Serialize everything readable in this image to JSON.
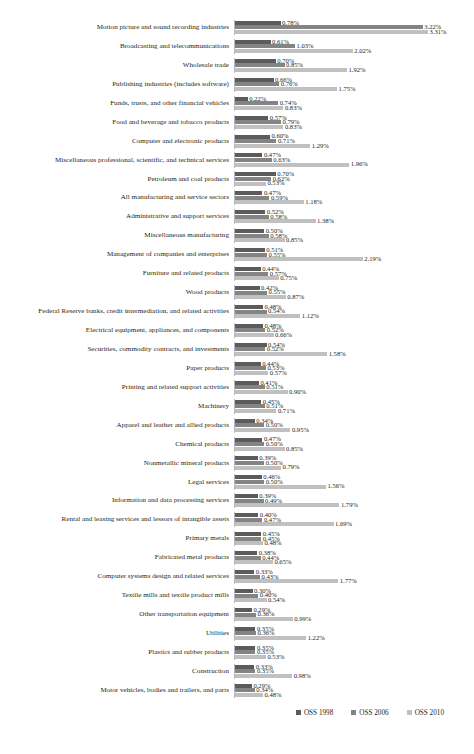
{
  "chart_data": {
    "type": "bar",
    "orientation": "horizontal",
    "title": "",
    "subtitle": "",
    "xlabel": "",
    "ylabel": "",
    "grid": false,
    "axis_visible": true,
    "value_suffix": "%",
    "xlim": [
      0,
      3.6
    ],
    "legend_position": "bottom-right",
    "series": [
      {
        "name": "OSS 1998",
        "color": "#5b5b5b"
      },
      {
        "name": "OSS 2006",
        "color": "#848484"
      },
      {
        "name": "OSS 2010",
        "color": "#c0c0c0"
      }
    ],
    "categories": [
      "Motion picture and sound recording industries",
      "Broadcasting and telecommunications",
      "Wholesale trade",
      "Publishing industries (includes software)",
      "Funds, trusts, and other financial vehicles",
      "Food and beverage and tobacco products",
      "Computer and electronic products",
      "Miscellaneous professional, scientific, and technical services",
      "Petroleum and coal products",
      "All manufacturing and service sectors",
      "Administrative and support services",
      "Miscellaneous manufacturing",
      "Management of companies and enterprises",
      "Furniture and related products",
      "Wood products",
      "Federal Reserve banks, credit intermediation, and related activities",
      "Electrical equipment, appliances, and components",
      "Securities, commodity contracts, and investments",
      "Paper products",
      "Printing and related support activities",
      "Machinery",
      "Apparel and leather and allied products",
      "Chemical products",
      "Nonmetallic mineral products",
      "Legal services",
      "Information and data processing services",
      "Rental and leasing services and lessors of intangible assets",
      "Primary metals",
      "Fabricated metal products",
      "Computer systems design and related services",
      "Textile mills and textile product mills",
      "Other transportation equipment",
      "Utilities",
      "Plastics and rubber products",
      "Construction",
      "Motor vehicles, bodies and  trailers, and parts"
    ],
    "rows": [
      {
        "category": "Motion picture and sound recording industries",
        "values": [
          0.78,
          3.22,
          3.31
        ],
        "labels": [
          "0.78%",
          "3.22%",
          "3.31%"
        ]
      },
      {
        "category": "Broadcasting and telecommunications",
        "values": [
          0.61,
          1.03,
          2.02
        ],
        "labels": [
          "0.61%",
          "1.03%",
          "2.02%"
        ]
      },
      {
        "category": "Wholesale trade",
        "values": [
          0.7,
          0.85,
          1.92
        ],
        "labels": [
          "0.70%",
          "0.85%",
          "1.92%"
        ]
      },
      {
        "category": "Publishing industries (includes software)",
        "values": [
          0.66,
          0.76,
          1.75
        ],
        "labels": [
          "0.66%",
          "0.76%",
          "1.75%"
        ]
      },
      {
        "category": "Funds, trusts, and other financial vehicles",
        "values": [
          0.22,
          0.74,
          0.83
        ],
        "labels": [
          "0.22%",
          "0.74%",
          "0.83%"
        ]
      },
      {
        "category": "Food and beverage and tobacco products",
        "values": [
          0.57,
          0.79,
          0.83
        ],
        "labels": [
          "0.57%",
          "0.79%",
          "0.83%"
        ]
      },
      {
        "category": "Computer and electronic products",
        "values": [
          0.6,
          0.71,
          1.29
        ],
        "labels": [
          "0.60%",
          "0.71%",
          "1.29%"
        ]
      },
      {
        "category": "Miscellaneous professional, scientific, and technical services",
        "values": [
          0.47,
          0.63,
          1.96
        ],
        "labels": [
          "0.47%",
          "0.63%",
          "1.96%"
        ]
      },
      {
        "category": "Petroleum and coal products",
        "values": [
          0.7,
          0.62,
          0.53
        ],
        "labels": [
          "0.70%",
          "0.62%",
          "0.53%"
        ]
      },
      {
        "category": "All manufacturing and service sectors",
        "values": [
          0.47,
          0.59,
          1.18
        ],
        "labels": [
          "0.47%",
          "0.59%",
          "1.18%"
        ]
      },
      {
        "category": "Administrative and support services",
        "values": [
          0.52,
          0.58,
          1.38
        ],
        "labels": [
          "0.52%",
          "0.58%",
          "1.38%"
        ]
      },
      {
        "category": "Miscellaneous manufacturing",
        "values": [
          0.5,
          0.58,
          0.85
        ],
        "labels": [
          "0.50%",
          "0.58%",
          "0.85%"
        ]
      },
      {
        "category": "Management of companies and enterprises",
        "values": [
          0.51,
          0.55,
          2.19
        ],
        "labels": [
          "0.51%",
          "0.55%",
          "2.19%"
        ]
      },
      {
        "category": "Furniture and related products",
        "values": [
          0.44,
          0.57,
          0.75
        ],
        "labels": [
          "0.44%",
          "0.57%",
          "0.75%"
        ]
      },
      {
        "category": "Wood products",
        "values": [
          0.42,
          0.55,
          0.87
        ],
        "labels": [
          "0.42%",
          "0.55%",
          "0.87%"
        ]
      },
      {
        "category": "Federal Reserve banks, credit intermediation, and related activities",
        "values": [
          0.48,
          0.54,
          1.12
        ],
        "labels": [
          "0.48%",
          "0.54%",
          "1.12%"
        ]
      },
      {
        "category": "Electrical equipment, appliances, and components",
        "values": [
          0.48,
          0.52,
          0.66
        ],
        "labels": [
          "0.48%",
          "0.52%",
          "0.66%"
        ]
      },
      {
        "category": "Securities, commodity contracts, and investments",
        "values": [
          0.54,
          0.52,
          1.58
        ],
        "labels": [
          "0.54%",
          "0.52%",
          "1.58%"
        ]
      },
      {
        "category": "Paper products",
        "values": [
          0.44,
          0.53,
          0.57
        ],
        "labels": [
          "0.44%",
          "0.53%",
          "0.57%"
        ]
      },
      {
        "category": "Printing and related support activities",
        "values": [
          0.41,
          0.51,
          0.9
        ],
        "labels": [
          "0.41%",
          "0.51%",
          "0.90%"
        ]
      },
      {
        "category": "Machinery",
        "values": [
          0.45,
          0.51,
          0.71
        ],
        "labels": [
          "0.45%",
          "0.51%",
          "0.71%"
        ]
      },
      {
        "category": "Apparel and leather and allied products",
        "values": [
          0.34,
          0.5,
          0.95
        ],
        "labels": [
          "0.34%",
          "0.50%",
          "0.95%"
        ]
      },
      {
        "category": "Chemical products",
        "values": [
          0.47,
          0.5,
          0.85
        ],
        "labels": [
          "0.47%",
          "0.50%",
          "0.85%"
        ]
      },
      {
        "category": "Nonmetallic mineral products",
        "values": [
          0.39,
          0.5,
          0.79
        ],
        "labels": [
          "0.39%",
          "0.50%",
          "0.79%"
        ]
      },
      {
        "category": "Legal services",
        "values": [
          0.46,
          0.5,
          1.56
        ],
        "labels": [
          "0.46%",
          "0.50%",
          "1.56%"
        ]
      },
      {
        "category": "Information and data processing services",
        "values": [
          0.39,
          0.49,
          1.79
        ],
        "labels": [
          "0.39%",
          "0.49%",
          "1.79%"
        ]
      },
      {
        "category": "Rental and leasing services and lessors of intangible assets",
        "values": [
          0.4,
          0.47,
          1.69
        ],
        "labels": [
          "0.40%",
          "0.47%",
          "1.69%"
        ]
      },
      {
        "category": "Primary metals",
        "values": [
          0.45,
          0.45,
          0.48
        ],
        "labels": [
          "0.45%",
          "0.45%",
          "0.48%"
        ]
      },
      {
        "category": "Fabricated metal products",
        "values": [
          0.38,
          0.44,
          0.65
        ],
        "labels": [
          "0.38%",
          "0.44%",
          "0.65%"
        ]
      },
      {
        "category": "Computer systems design and related services",
        "values": [
          0.33,
          0.43,
          1.77
        ],
        "labels": [
          "0.33%",
          "0.43%",
          "1.77%"
        ]
      },
      {
        "category": "Textile mills and textile product mills",
        "values": [
          0.3,
          0.4,
          0.54
        ],
        "labels": [
          "0.30%",
          "0.40%",
          "0.54%"
        ]
      },
      {
        "category": "Other transportation equipment",
        "values": [
          0.29,
          0.36,
          0.99
        ],
        "labels": [
          "0.29%",
          "0.36%",
          "0.99%"
        ]
      },
      {
        "category": "Utilities",
        "values": [
          0.35,
          0.36,
          1.22
        ],
        "labels": [
          "0.35%",
          "0.36%",
          "1.22%"
        ]
      },
      {
        "category": "Plastics and rubber products",
        "values": [
          0.35,
          0.35,
          0.53
        ],
        "labels": [
          "0.35%",
          "0.35%",
          "0.53%"
        ]
      },
      {
        "category": "Construction",
        "values": [
          0.33,
          0.35,
          0.98
        ],
        "labels": [
          "0.33%",
          "0.35%",
          "0.98%"
        ]
      },
      {
        "category": "Motor vehicles, bodies and  trailers, and parts",
        "values": [
          0.29,
          0.34,
          0.48
        ],
        "labels": [
          "0.29%",
          "0.34%",
          "0.48%"
        ]
      }
    ]
  }
}
